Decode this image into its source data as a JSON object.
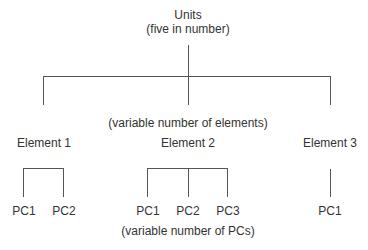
{
  "root": {
    "title": "Units",
    "subtitle": "(five in number)"
  },
  "elements_note": "(variable number of elements)",
  "pcs_note": "(variable number of PCs)",
  "elements": [
    {
      "label": "Element 1",
      "pcs": [
        "PC1",
        "PC2"
      ]
    },
    {
      "label": "Element 2",
      "pcs": [
        "PC1",
        "PC2",
        "PC3"
      ]
    },
    {
      "label": "Element 3",
      "pcs": [
        "PC1"
      ]
    }
  ]
}
